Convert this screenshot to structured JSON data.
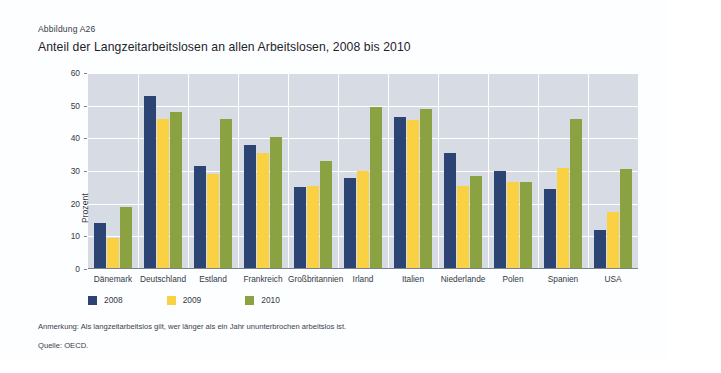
{
  "figure": {
    "number": "Abbildung A26",
    "title": "Anteil der Langzeitarbeitslosen an allen Arbeitslosen, 2008 bis 2010",
    "note": "Anmerkung: Als langzeitarbeitslos gilt, wer länger als ein Jahr ununterbrochen arbeitslos ist.",
    "source": "Quelle: OECD."
  },
  "colors": {
    "series_2008": "#2c4473",
    "series_2009": "#fbd144",
    "series_2010": "#8ba242",
    "plot_background": "#d7dbe4",
    "gridline": "#ffffff",
    "card_background": "#fdfeff",
    "text": "#333a3f"
  },
  "chart_data": {
    "type": "bar",
    "title": "Anteil der Langzeitarbeitslosen an allen Arbeitslosen, 2008 bis 2010",
    "xlabel": "",
    "ylabel": "Prozent",
    "ylim": [
      0,
      60
    ],
    "yticks": [
      0,
      10,
      20,
      30,
      40,
      50,
      60
    ],
    "ytick_labels": [
      "0",
      "10",
      "20",
      "30",
      "40",
      "50",
      "60"
    ],
    "grid": true,
    "legend_position": "bottom-left",
    "categories": [
      "Dänemark",
      "Deutschland",
      "Estland",
      "Frankreich",
      "Großbritannien",
      "Irland",
      "Italien",
      "Niederlande",
      "Polen",
      "Spanien",
      "USA"
    ],
    "series": [
      {
        "name": "2008",
        "color": "#2c4473",
        "values": [
          14,
          53,
          31.5,
          38,
          25,
          28,
          46.5,
          35.5,
          30,
          24.5,
          11.8
        ]
      },
      {
        "name": "2009",
        "color": "#fbd144",
        "values": [
          9.5,
          46,
          29,
          35.5,
          25.5,
          30,
          45.5,
          25.5,
          26.5,
          31,
          17.5
        ]
      },
      {
        "name": "2010",
        "color": "#8ba242",
        "values": [
          19,
          48,
          46,
          40.5,
          33,
          49.5,
          49,
          28.5,
          26.5,
          46,
          30.5
        ]
      }
    ]
  }
}
